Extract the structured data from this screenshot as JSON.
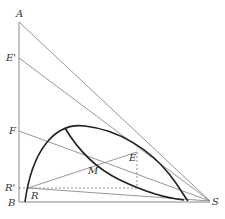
{
  "diagram": {
    "labels": {
      "A": "A",
      "E_prime": "E'",
      "F": "F",
      "R_prime": "R'",
      "B": "B",
      "R": "R",
      "M": "M",
      "E": "E",
      "S": "S"
    },
    "colors": {
      "line": "#8a8a8a",
      "curve": "#222222",
      "text": "#333333"
    }
  }
}
